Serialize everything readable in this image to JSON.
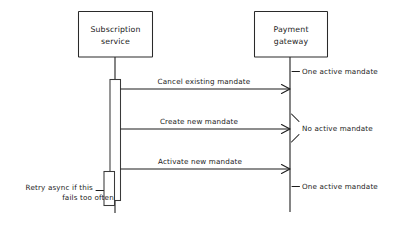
{
  "diagram": {
    "type": "sequence-diagram",
    "title": "",
    "background_color": "#ffffff",
    "line_color": "#1d1d1d",
    "participants": [
      {
        "id": "subscription-service",
        "label_line1": "Subscription",
        "label_line2": "service"
      },
      {
        "id": "payment-gateway",
        "label_line1": "Payment",
        "label_line2": "gateway"
      }
    ],
    "messages": [
      {
        "id": "cancel-existing-mandate",
        "label": "Cancel existing mandate",
        "from": "subscription-service",
        "to": "payment-gateway",
        "direction": "right"
      },
      {
        "id": "create-new-mandate",
        "label": "Create new mandate",
        "from": "subscription-service",
        "to": "payment-gateway",
        "direction": "right"
      },
      {
        "id": "activate-new-mandate",
        "label": "Activate new mandate",
        "from": "subscription-service",
        "to": "payment-gateway",
        "direction": "right"
      }
    ],
    "state_annotations": [
      {
        "id": "state-one-active-top",
        "label": "One active mandate",
        "marker": "dash"
      },
      {
        "id": "state-no-active",
        "label": "No active mandate",
        "marker": "bracket"
      },
      {
        "id": "state-one-active-bottom",
        "label": "One active mandate",
        "marker": "dash"
      }
    ],
    "notes": [
      {
        "id": "retry-note",
        "line1": "Retry async if this",
        "line2": "fails too often",
        "attached_to": "subscription-service"
      }
    ]
  }
}
